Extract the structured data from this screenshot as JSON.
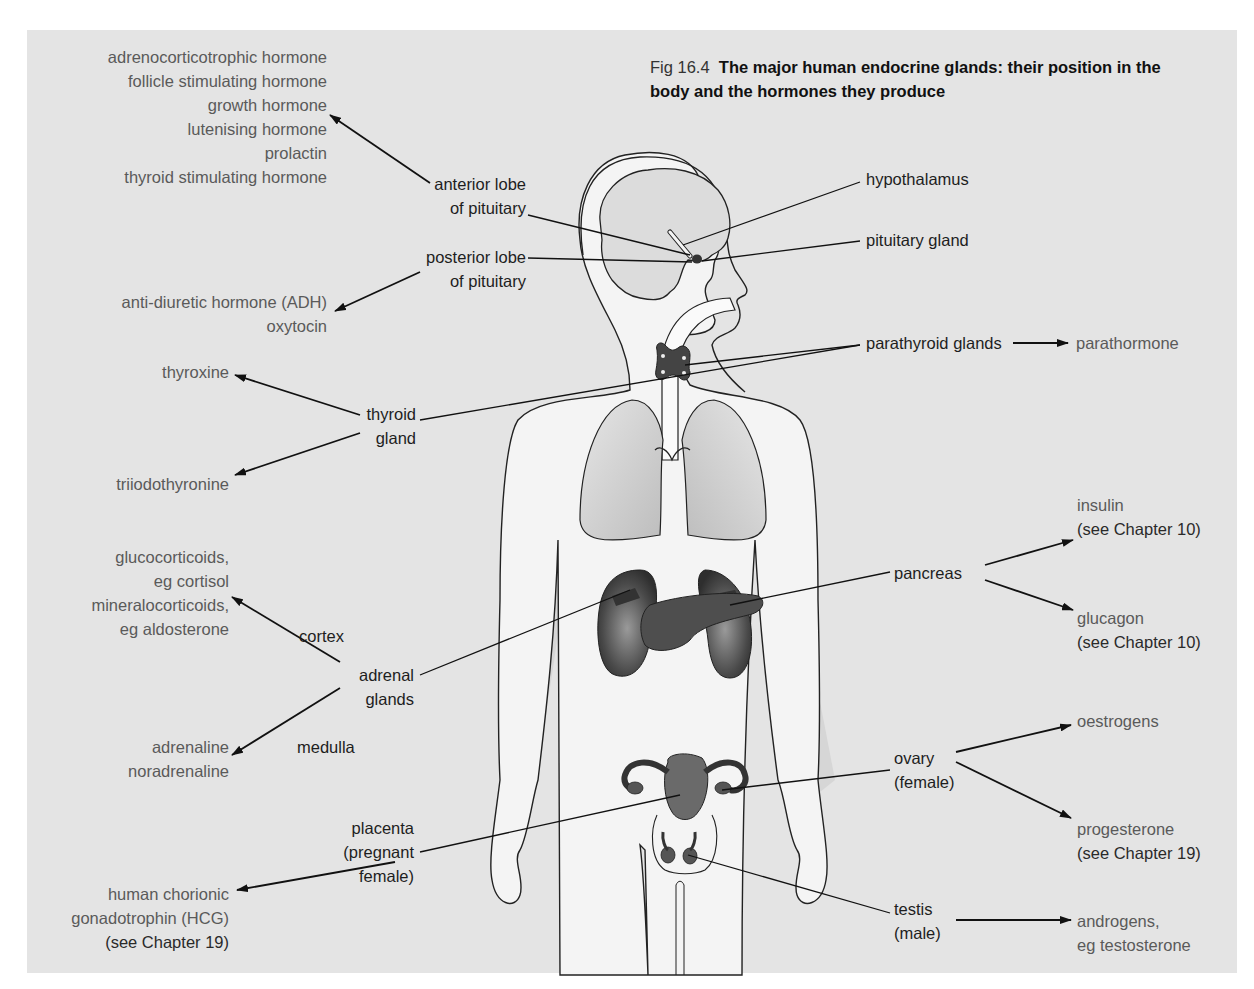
{
  "figure": {
    "number": "Fig 16.4",
    "title": "The major human endocrine glands: their position in the body and the hormones they produce",
    "colors": {
      "panel_background": "#e4e4e4",
      "body_fill": "#f4f4f4",
      "organ_dark": "#555555",
      "lung_fill": "#cfcfcf",
      "hormone_text": "#5a5a5a",
      "gland_text": "#1e1e1e"
    }
  },
  "pituitary_anterior": {
    "gland_lines": [
      "anterior lobe",
      "of pituitary"
    ],
    "hormones": [
      "adrenocorticotrophic hormone",
      "follicle stimulating hormone",
      "growth hormone",
      "lutenising hormone",
      "prolactin",
      "thyroid stimulating hormone"
    ]
  },
  "pituitary_posterior": {
    "gland_lines": [
      "posterior lobe",
      "of pituitary"
    ],
    "hormones": [
      "anti-diuretic hormone (ADH)",
      "oxytocin"
    ]
  },
  "hypothalamus": {
    "label": "hypothalamus"
  },
  "pituitary_gland": {
    "label": "pituitary gland"
  },
  "parathyroid": {
    "label": "parathyroid glands",
    "hormones": [
      "parathormone"
    ]
  },
  "thyroid": {
    "gland_lines": [
      "thyroid",
      "gland"
    ],
    "hormones": [
      "thyroxine",
      "triiodothyronine"
    ]
  },
  "adrenal": {
    "gland_lines": [
      "adrenal",
      "glands"
    ],
    "cortex_label": "cortex",
    "medulla_label": "medulla",
    "cortex_hormones": [
      "glucocorticoids,",
      "eg cortisol",
      "mineralocorticoids,",
      "eg aldosterone"
    ],
    "medulla_hormones": [
      "adrenaline",
      "noradrenaline"
    ]
  },
  "pancreas": {
    "label": "pancreas",
    "insulin": [
      "insulin",
      "(see Chapter 10)"
    ],
    "glucagon": [
      "glucagon",
      "(see Chapter 10)"
    ]
  },
  "ovary": {
    "gland_lines": [
      "ovary",
      "(female)"
    ],
    "oestrogens": [
      "oestrogens"
    ],
    "progesterone": [
      "progesterone",
      "(see Chapter 19)"
    ]
  },
  "placenta": {
    "gland_lines": [
      "placenta",
      "(pregnant",
      "female)"
    ],
    "hormones": [
      "human chorionic",
      "gonadotrophin (HCG)",
      "(see Chapter 19)"
    ]
  },
  "testis": {
    "gland_lines": [
      "testis",
      "(male)"
    ],
    "hormones": [
      "androgens,",
      "eg testosterone"
    ]
  }
}
